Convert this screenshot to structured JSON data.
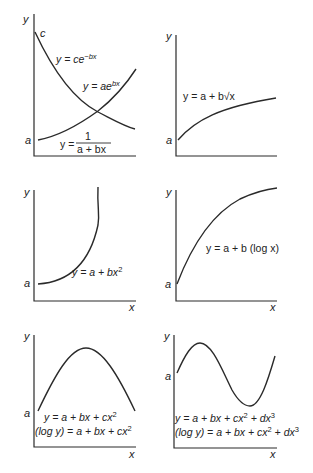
{
  "figure": {
    "panels": [
      {
        "id": "exponential-and-reciprocal",
        "axis_labels": {
          "x": "",
          "y": "y"
        },
        "intercept_labels": [
          "c",
          "a"
        ],
        "equations": [
          "y = ce^(-bx)",
          "y = ae^(bx)",
          "y = 1/(a + bx)"
        ]
      },
      {
        "id": "square-root",
        "axis_labels": {
          "x": "",
          "y": "y"
        },
        "intercept_labels": [
          "a"
        ],
        "equations": [
          "y = a + b√x"
        ]
      },
      {
        "id": "quadratic-power",
        "axis_labels": {
          "x": "x",
          "y": "y"
        },
        "intercept_labels": [
          "a"
        ],
        "equations": [
          "y = a + bx²"
        ]
      },
      {
        "id": "logarithmic",
        "axis_labels": {
          "x": "x",
          "y": "y"
        },
        "intercept_labels": [
          "a"
        ],
        "equations": [
          "y = a + b (log x)"
        ]
      },
      {
        "id": "second-order-polynomial",
        "axis_labels": {
          "x": "x",
          "y": "y"
        },
        "intercept_labels": [
          "a"
        ],
        "equations": [
          "y = a + bx + cx²",
          "(log y) = a + bx + cx²"
        ]
      },
      {
        "id": "third-order-polynomial",
        "axis_labels": {
          "x": "x",
          "y": "y"
        },
        "intercept_labels": [
          "a"
        ],
        "equations": [
          "y = a + bx + cx² + dx³",
          "(log y) = a + bx + cx² + dx³"
        ]
      }
    ]
  },
  "labels": {
    "y": "y",
    "x": "x",
    "a": "a",
    "c": "c",
    "p1_eq1_base": "y = ce",
    "p1_eq1_exp": "−bx",
    "p1_eq2_base": "y = ae",
    "p1_eq2_exp": "bx",
    "p1_eq3_lhs": "y =",
    "p1_eq3_num": "1",
    "p1_eq3_den": "a + bx",
    "p2_eq": "y = a + b√x",
    "p3_eq_base": "y = a + bx",
    "p3_eq_exp": "2",
    "p4_eq": "y = a + b (log x)",
    "p5_eq1_base": "y = a + bx + cx",
    "p5_eq1_exp": "2",
    "p5_eq2_base": "(log y) = a + bx + cx",
    "p5_eq2_exp": "2",
    "p6_eq1_base": "y = a + bx + cx",
    "p6_eq1_mid": " + dx",
    "p6_eq1_exp1": "2",
    "p6_eq1_exp2": "3",
    "p6_eq2_base": "(log y) = a + bx + cx",
    "p6_eq2_mid": " + dx",
    "p6_eq2_exp1": "2",
    "p6_eq2_exp2": "3"
  },
  "colors": {
    "line": "#2a2a2a",
    "background": "#ffffff"
  }
}
